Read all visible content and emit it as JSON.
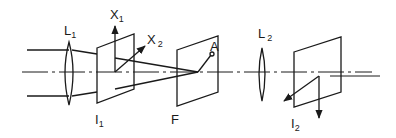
{
  "diagram": {
    "title": "",
    "type": "optical-setup",
    "colors": {
      "stroke": "#1a1a1a",
      "background": "#ffffff"
    },
    "labels": {
      "lens1": {
        "main": "L",
        "sub": "1"
      },
      "lens2": {
        "main": "L",
        "sub": "2"
      },
      "image_plane1": {
        "main": "I",
        "sub": "1"
      },
      "image_plane2": {
        "main": "I",
        "sub": "2"
      },
      "filter_plane": {
        "main": "F"
      },
      "axis_x1": {
        "main": "X",
        "sub": "1"
      },
      "axis_x2": {
        "main": "X",
        "sub": "2"
      },
      "point_a": {
        "main": "A"
      }
    },
    "elements": [
      {
        "id": "lens1",
        "kind": "lens",
        "label": "L1"
      },
      {
        "id": "image_plane1",
        "kind": "plane",
        "label": "I1",
        "axes": [
          "X1",
          "X2"
        ]
      },
      {
        "id": "filter_plane",
        "kind": "plane",
        "label": "F",
        "point": "A"
      },
      {
        "id": "lens2",
        "kind": "lens",
        "label": "L2"
      },
      {
        "id": "image_plane2",
        "kind": "plane",
        "label": "I2"
      }
    ]
  }
}
